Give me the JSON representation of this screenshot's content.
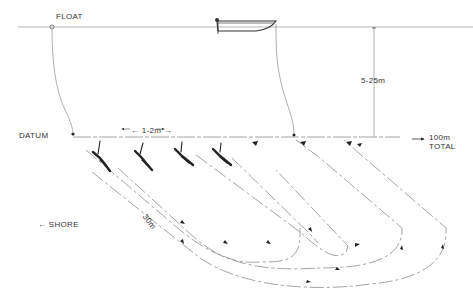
{
  "labels": {
    "float": "FLOAT",
    "depth_range": "5-25m",
    "datum": "DATUM",
    "diver_spacing": "← 1-2m →",
    "total_line1": "100m",
    "total_line2": "TOTAL",
    "shore": "← SHORE",
    "transect_length": "30m"
  },
  "elements": {
    "surface_line": "water surface",
    "boat": "support boat",
    "float_line": "float marker line to datum",
    "boat_line": "boat anchor line to seabed",
    "datum_line": "seabed datum line",
    "divers_count": 4,
    "swim_paths_count": 4
  },
  "colors": {
    "line": "#9a9a9a",
    "ink": "#222222",
    "text": "#333333",
    "background": "#ffffff"
  }
}
